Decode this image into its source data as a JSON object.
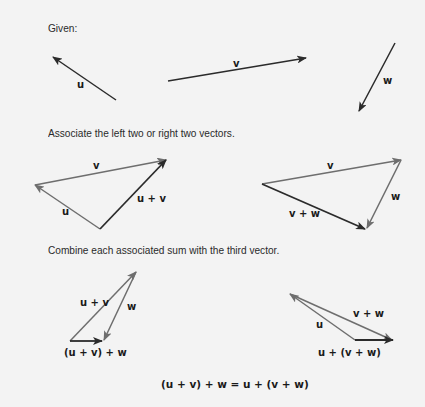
{
  "captions": {
    "given": "Given:",
    "associate": "Associate the left two or right two vectors.",
    "combine": "Combine each associated sum with the third vector."
  },
  "labels": {
    "u": "u",
    "v": "v",
    "w": "w",
    "u_plus_v": "u + v",
    "v_plus_w": "v + w",
    "upv_plus_w": "(u + v) + w",
    "u_plus_vpw": "u + (v + w)"
  },
  "equation": "(u + v) + w = u + (v + w)",
  "colors": {
    "background": "#f3f3f3",
    "vector_dark": "#2b2b2b",
    "vector_gray": "#6e6e6e"
  }
}
